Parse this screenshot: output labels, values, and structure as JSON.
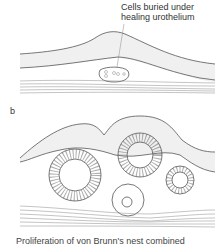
{
  "figure": {
    "panel_a": {
      "callout": [
        "Cells buried under",
        "healing urothelium"
      ]
    },
    "panel_b": {
      "label": "b"
    },
    "caption": "Proliferation of von Brunn's nest combined"
  }
}
